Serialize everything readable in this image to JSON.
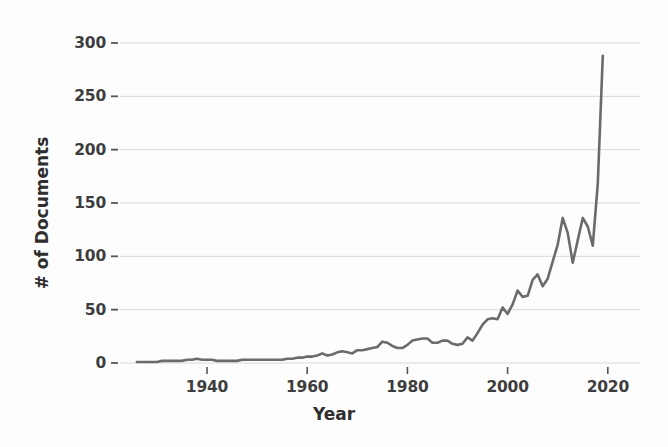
{
  "chart_data": {
    "type": "line",
    "title": "",
    "xlabel": "Year",
    "ylabel": "# of Documents",
    "xlim": [
      1925,
      2022
    ],
    "ylim": [
      0,
      310
    ],
    "xticks": [
      1940,
      1960,
      1980,
      2000,
      2020
    ],
    "xtick_labels": [
      "1940",
      "1960",
      "1980",
      "2000",
      "2020"
    ],
    "yticks": [
      0,
      50,
      100,
      150,
      200,
      250,
      300
    ],
    "ytick_labels": [
      "0",
      "50",
      "100",
      "150",
      "200",
      "250",
      "300"
    ],
    "grid": true,
    "grid_axis": "y",
    "legend": false,
    "legend_position": "none",
    "line_color": "#6b6b6b",
    "grid_color": "#d8d8d8",
    "text_color": "#3d3d3d",
    "background_color": "#fdfdfd",
    "series": [
      {
        "name": "# of Documents",
        "x": [
          1926,
          1927,
          1928,
          1929,
          1930,
          1931,
          1932,
          1933,
          1934,
          1935,
          1936,
          1937,
          1938,
          1939,
          1940,
          1941,
          1942,
          1943,
          1944,
          1945,
          1946,
          1947,
          1948,
          1949,
          1950,
          1951,
          1952,
          1953,
          1954,
          1955,
          1956,
          1957,
          1958,
          1959,
          1960,
          1961,
          1962,
          1963,
          1964,
          1965,
          1966,
          1967,
          1968,
          1969,
          1970,
          1971,
          1972,
          1973,
          1974,
          1975,
          1976,
          1977,
          1978,
          1979,
          1980,
          1981,
          1982,
          1983,
          1984,
          1985,
          1986,
          1987,
          1988,
          1989,
          1990,
          1991,
          1992,
          1993,
          1994,
          1995,
          1996,
          1997,
          1998,
          1999,
          2000,
          2001,
          2002,
          2003,
          2004,
          2005,
          2006,
          2007,
          2008,
          2009,
          2010,
          2011,
          2012,
          2013,
          2014,
          2015,
          2016,
          2017,
          2018,
          2019
        ],
        "values": [
          1,
          1,
          1,
          1,
          1,
          2,
          2,
          2,
          2,
          2,
          3,
          3,
          4,
          3,
          3,
          3,
          2,
          2,
          2,
          2,
          2,
          3,
          3,
          3,
          3,
          3,
          3,
          3,
          3,
          3,
          4,
          4,
          5,
          5,
          6,
          6,
          7,
          9,
          7,
          8,
          10,
          11,
          10,
          9,
          12,
          12,
          13,
          14,
          15,
          20,
          19,
          16,
          14,
          14,
          17,
          21,
          22,
          23,
          23,
          19,
          19,
          21,
          21,
          18,
          17,
          18,
          24,
          21,
          28,
          36,
          41,
          42,
          41,
          52,
          46,
          55,
          68,
          62,
          63,
          78,
          83,
          72,
          79,
          95,
          111,
          136,
          122,
          94,
          115,
          136,
          128,
          110,
          168,
          288
        ]
      }
    ]
  }
}
